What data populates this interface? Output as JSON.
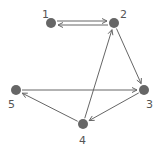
{
  "graph": {
    "node_color": "#666666",
    "edge_color": "#666666",
    "nodes": [
      {
        "id": "1",
        "label": "1",
        "x": 51,
        "y": 23,
        "lx": 42,
        "ly": 18
      },
      {
        "id": "2",
        "label": "2",
        "x": 114,
        "y": 23,
        "lx": 120,
        "ly": 18
      },
      {
        "id": "3",
        "label": "3",
        "x": 144,
        "y": 90,
        "lx": 146,
        "ly": 108
      },
      {
        "id": "4",
        "label": "4",
        "x": 83,
        "y": 124,
        "lx": 79,
        "ly": 144
      },
      {
        "id": "5",
        "label": "5",
        "x": 16,
        "y": 90,
        "lx": 8,
        "ly": 108
      }
    ],
    "edges": [
      {
        "from": "1",
        "to": "2",
        "offset": -2
      },
      {
        "from": "2",
        "to": "1",
        "offset": -2
      },
      {
        "from": "2",
        "to": "3",
        "offset": 0
      },
      {
        "from": "4",
        "to": "2",
        "offset": 0
      },
      {
        "from": "5",
        "to": "3",
        "offset": 0
      },
      {
        "from": "3",
        "to": "4",
        "offset": 0
      },
      {
        "from": "4",
        "to": "5",
        "offset": 0
      }
    ]
  }
}
